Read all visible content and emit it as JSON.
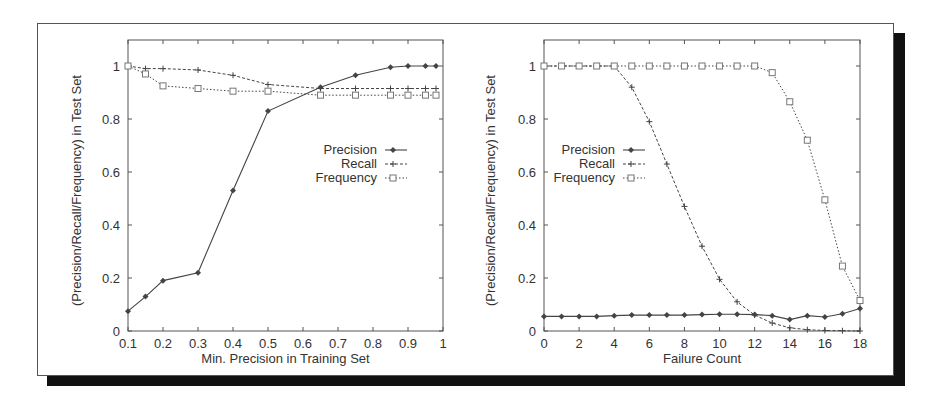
{
  "chart_data": [
    {
      "type": "line",
      "title": "",
      "xlabel": "Min. Precision in Training Set",
      "ylabel": "(Precision/Recall/Frequency) in Test Set",
      "xlim": [
        0.1,
        1.0
      ],
      "ylim": [
        0,
        1.1
      ],
      "xticks": [
        "0.1",
        "0.2",
        "0.3",
        "0.4",
        "0.5",
        "0.6",
        "0.7",
        "0.8",
        "0.9",
        "1"
      ],
      "yticks": [
        "0",
        "0.2",
        "0.4",
        "0.6",
        "0.8",
        "1"
      ],
      "grid": false,
      "legend_position": "center-right",
      "x": [
        0.1,
        0.15,
        0.2,
        0.3,
        0.4,
        0.5,
        0.65,
        0.75,
        0.85,
        0.9,
        0.95,
        0.98
      ],
      "series": [
        {
          "name": "Precision",
          "marker": "diamond",
          "line": "solid",
          "values": [
            0.075,
            0.13,
            0.19,
            0.22,
            0.53,
            0.83,
            0.92,
            0.965,
            0.995,
            1.0,
            1.0,
            1.0
          ]
        },
        {
          "name": "Recall",
          "marker": "plus",
          "line": "dashed",
          "values": [
            1.0,
            0.99,
            0.99,
            0.985,
            0.965,
            0.93,
            0.915,
            0.915,
            0.915,
            0.915,
            0.915,
            0.915
          ]
        },
        {
          "name": "Frequency",
          "marker": "square",
          "line": "dotted",
          "values": [
            1.0,
            0.97,
            0.925,
            0.915,
            0.905,
            0.905,
            0.89,
            0.89,
            0.89,
            0.89,
            0.89,
            0.89
          ]
        }
      ]
    },
    {
      "type": "line",
      "title": "",
      "xlabel": "Failure Count",
      "ylabel": "(Precision/Recall/Frequency) in Test Set",
      "xlim": [
        0,
        18
      ],
      "ylim": [
        0,
        1.1
      ],
      "xticks": [
        "0",
        "2",
        "4",
        "6",
        "8",
        "10",
        "12",
        "14",
        "16",
        "18"
      ],
      "yticks": [
        "0",
        "0.2",
        "0.4",
        "0.6",
        "0.8",
        "1"
      ],
      "grid": false,
      "legend_position": "center-left",
      "x": [
        0,
        1,
        2,
        3,
        4,
        5,
        6,
        7,
        8,
        9,
        10,
        11,
        12,
        13,
        14,
        15,
        16,
        17,
        18
      ],
      "series": [
        {
          "name": "Precision",
          "marker": "diamond",
          "line": "solid",
          "values": [
            0.055,
            0.055,
            0.055,
            0.055,
            0.058,
            0.06,
            0.06,
            0.06,
            0.06,
            0.062,
            0.063,
            0.063,
            0.062,
            0.058,
            0.043,
            0.058,
            0.053,
            0.065,
            0.085
          ]
        },
        {
          "name": "Recall",
          "marker": "plus",
          "line": "dashed",
          "values": [
            1.0,
            1.0,
            1.0,
            1.0,
            1.0,
            0.92,
            0.79,
            0.63,
            0.47,
            0.32,
            0.195,
            0.11,
            0.06,
            0.03,
            0.012,
            0.005,
            0.002,
            0.001,
            0.0
          ]
        },
        {
          "name": "Frequency",
          "marker": "square",
          "line": "dotted",
          "values": [
            1.0,
            1.0,
            1.0,
            1.0,
            1.0,
            1.0,
            1.0,
            1.0,
            1.0,
            1.0,
            1.0,
            1.0,
            1.0,
            0.975,
            0.865,
            0.72,
            0.495,
            0.245,
            0.115
          ]
        }
      ]
    }
  ],
  "colors": {
    "axis": "#555555",
    "text": "#333333",
    "series": "#444444",
    "frequency_marker": "#777777",
    "shadow": "#111111"
  }
}
